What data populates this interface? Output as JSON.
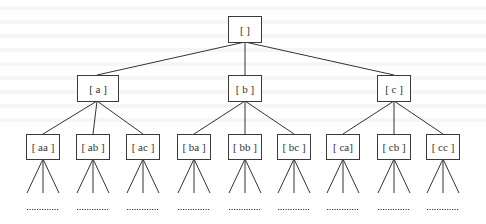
{
  "diagram": {
    "type": "tree",
    "root": {
      "id": "root",
      "label": "[ ]"
    },
    "level1": [
      {
        "id": "a",
        "label": "[ a ]"
      },
      {
        "id": "b",
        "label": "[ b ]"
      },
      {
        "id": "c",
        "label": "[ c ]"
      }
    ],
    "level2": [
      {
        "id": "aa",
        "parent": "a",
        "label": "[ aa ]"
      },
      {
        "id": "ab",
        "parent": "a",
        "label": "[ ab ]"
      },
      {
        "id": "ac",
        "parent": "a",
        "label": "[ ac ]"
      },
      {
        "id": "ba",
        "parent": "b",
        "label": "[ ba ]"
      },
      {
        "id": "bb",
        "parent": "b",
        "label": "[ bb ]"
      },
      {
        "id": "bc",
        "parent": "b",
        "label": "[ bc ]"
      },
      {
        "id": "ca",
        "parent": "c",
        "label": "[ ca]"
      },
      {
        "id": "cb",
        "parent": "c",
        "label": "[ cb ]"
      },
      {
        "id": "cc",
        "parent": "c",
        "label": "[ cc ]"
      }
    ],
    "continuation": "..........",
    "colors": {
      "line": "#333333",
      "box_border": "#3a3a3a",
      "text": "#333333",
      "background": "#ffffff"
    }
  }
}
